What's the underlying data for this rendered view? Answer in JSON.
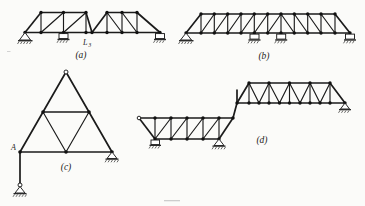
{
  "figure": {
    "background_color": "#fbfbf9",
    "line_color": "#1b1b1b",
    "joint_color": "#111111",
    "panels": [
      {
        "id": "a",
        "caption": "(a)",
        "type": "continuous-pratt-truss",
        "description": "Three-span parallel chord truss with diagonals, supported on one pin and two rollers",
        "node_labels": [
          {
            "text": "L",
            "subscript": "3"
          }
        ],
        "supports": [
          "pin",
          "roller",
          "roller"
        ]
      },
      {
        "id": "b",
        "caption": "(b)",
        "type": "two-span-pratt-truss",
        "description": "Long parallel chord truss with sloped end panels, four supports",
        "node_labels": [],
        "supports": [
          "pin",
          "roller",
          "roller",
          "roller"
        ]
      },
      {
        "id": "c",
        "caption": "(c)",
        "type": "triangular-truss",
        "description": "Equilateral triangular truss subdivided into four smaller triangles with a hanging vertical link at joint A",
        "node_labels": [
          {
            "text": "A",
            "subscript": ""
          }
        ],
        "supports": [
          "pin-hanger",
          "roller"
        ]
      },
      {
        "id": "d",
        "caption": "(d)",
        "type": "stepped-truss",
        "description": "Offset two-level truss, lower left bay and raised right bay joined by a vertical step",
        "node_labels": [],
        "supports": [
          "roller",
          "roller",
          "roller"
        ]
      }
    ]
  },
  "labels": {
    "caption_a": "(a)",
    "caption_b": "(b)",
    "caption_c": "(c)",
    "caption_d": "(d)",
    "node_L3_main": "L",
    "node_L3_sub": "3",
    "node_A": "A"
  }
}
